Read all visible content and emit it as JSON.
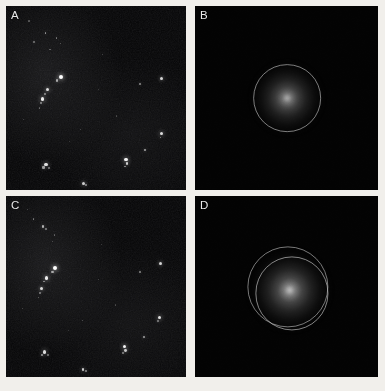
{
  "figure": {
    "background_color": "#f1efeb",
    "panel_background": "#050505",
    "label_color": "#e8e8e8",
    "ring_color": "#c4c4c4",
    "layout": "2x2 grid of image panels",
    "columns": 2,
    "rows": 2
  },
  "panels": [
    {
      "id": "A",
      "label": "A",
      "kind": "micrograph",
      "position": "top-left",
      "x": 6,
      "y": 6,
      "width": 180,
      "height": 184,
      "description": "dark field micrograph with scattered bright particles",
      "spots": [
        {
          "x": 0.22,
          "y": 0.145,
          "r": 0.9,
          "b": 0.55
        },
        {
          "x": 0.28,
          "y": 0.175,
          "r": 0.8,
          "b": 0.42
        },
        {
          "x": 0.155,
          "y": 0.195,
          "r": 0.7,
          "b": 0.38
        },
        {
          "x": 0.305,
          "y": 0.205,
          "r": 0.6,
          "b": 0.3
        },
        {
          "x": 0.245,
          "y": 0.235,
          "r": 0.7,
          "b": 0.34
        },
        {
          "x": 0.305,
          "y": 0.385,
          "r": 2.1,
          "b": 1.0
        },
        {
          "x": 0.285,
          "y": 0.405,
          "r": 1.1,
          "b": 0.62
        },
        {
          "x": 0.232,
          "y": 0.455,
          "r": 1.5,
          "b": 0.85
        },
        {
          "x": 0.218,
          "y": 0.478,
          "r": 0.9,
          "b": 0.5
        },
        {
          "x": 0.205,
          "y": 0.505,
          "r": 1.6,
          "b": 0.92
        },
        {
          "x": 0.196,
          "y": 0.527,
          "r": 0.8,
          "b": 0.44
        },
        {
          "x": 0.185,
          "y": 0.555,
          "r": 0.7,
          "b": 0.36
        },
        {
          "x": 0.862,
          "y": 0.392,
          "r": 1.5,
          "b": 0.82
        },
        {
          "x": 0.742,
          "y": 0.425,
          "r": 1.0,
          "b": 0.52
        },
        {
          "x": 0.866,
          "y": 0.695,
          "r": 1.6,
          "b": 0.86
        },
        {
          "x": 0.858,
          "y": 0.715,
          "r": 0.9,
          "b": 0.48
        },
        {
          "x": 0.773,
          "y": 0.783,
          "r": 1.2,
          "b": 0.62
        },
        {
          "x": 0.666,
          "y": 0.835,
          "r": 1.7,
          "b": 0.95
        },
        {
          "x": 0.672,
          "y": 0.858,
          "r": 1.4,
          "b": 0.78
        },
        {
          "x": 0.66,
          "y": 0.872,
          "r": 0.9,
          "b": 0.5
        },
        {
          "x": 0.222,
          "y": 0.862,
          "r": 1.6,
          "b": 0.88
        },
        {
          "x": 0.208,
          "y": 0.878,
          "r": 1.1,
          "b": 0.58
        },
        {
          "x": 0.238,
          "y": 0.882,
          "r": 0.8,
          "b": 0.42
        },
        {
          "x": 0.432,
          "y": 0.962,
          "r": 1.5,
          "b": 0.8
        },
        {
          "x": 0.447,
          "y": 0.972,
          "r": 1.0,
          "b": 0.52
        },
        {
          "x": 0.128,
          "y": 0.082,
          "r": 0.6,
          "b": 0.28
        },
        {
          "x": 0.535,
          "y": 0.262,
          "r": 0.6,
          "b": 0.26
        },
        {
          "x": 0.612,
          "y": 0.598,
          "r": 0.6,
          "b": 0.24
        },
        {
          "x": 0.415,
          "y": 0.672,
          "r": 0.6,
          "b": 0.26
        },
        {
          "x": 0.098,
          "y": 0.618,
          "r": 0.6,
          "b": 0.25
        },
        {
          "x": 0.515,
          "y": 0.455,
          "r": 0.5,
          "b": 0.22
        },
        {
          "x": 0.352,
          "y": 0.735,
          "r": 0.5,
          "b": 0.2
        }
      ]
    },
    {
      "id": "B",
      "label": "B",
      "kind": "diffraction",
      "position": "top-right",
      "x": 195,
      "y": 6,
      "width": 183,
      "height": 184,
      "description": "radial diffraction halo with single circular ring overlay",
      "center_x": 0.505,
      "center_y": 0.5,
      "glow_radius": 0.215,
      "glow_peak": 0.78,
      "rings": [
        {
          "radius": 0.185,
          "offset_x": 0.0,
          "offset_y": 0.0,
          "opacity": 0.62
        }
      ]
    },
    {
      "id": "C",
      "label": "C",
      "kind": "micrograph",
      "position": "bottom-left",
      "x": 6,
      "y": 196,
      "width": 180,
      "height": 181,
      "description": "dark field micrograph with scattered bright particles",
      "spots": [
        {
          "x": 0.152,
          "y": 0.128,
          "r": 0.8,
          "b": 0.44
        },
        {
          "x": 0.205,
          "y": 0.168,
          "r": 1.2,
          "b": 0.66
        },
        {
          "x": 0.222,
          "y": 0.182,
          "r": 0.8,
          "b": 0.42
        },
        {
          "x": 0.268,
          "y": 0.215,
          "r": 0.7,
          "b": 0.34
        },
        {
          "x": 0.258,
          "y": 0.252,
          "r": 0.6,
          "b": 0.28
        },
        {
          "x": 0.272,
          "y": 0.398,
          "r": 2.0,
          "b": 1.0
        },
        {
          "x": 0.258,
          "y": 0.418,
          "r": 1.1,
          "b": 0.6
        },
        {
          "x": 0.225,
          "y": 0.452,
          "r": 1.7,
          "b": 0.92
        },
        {
          "x": 0.212,
          "y": 0.472,
          "r": 0.9,
          "b": 0.48
        },
        {
          "x": 0.198,
          "y": 0.512,
          "r": 1.5,
          "b": 0.84
        },
        {
          "x": 0.19,
          "y": 0.535,
          "r": 0.8,
          "b": 0.42
        },
        {
          "x": 0.182,
          "y": 0.562,
          "r": 0.7,
          "b": 0.35
        },
        {
          "x": 0.858,
          "y": 0.372,
          "r": 1.5,
          "b": 0.82
        },
        {
          "x": 0.742,
          "y": 0.418,
          "r": 1.0,
          "b": 0.5
        },
        {
          "x": 0.852,
          "y": 0.672,
          "r": 1.6,
          "b": 0.88
        },
        {
          "x": 0.845,
          "y": 0.692,
          "r": 0.9,
          "b": 0.46
        },
        {
          "x": 0.768,
          "y": 0.778,
          "r": 1.2,
          "b": 0.6
        },
        {
          "x": 0.658,
          "y": 0.832,
          "r": 1.7,
          "b": 0.95
        },
        {
          "x": 0.664,
          "y": 0.855,
          "r": 1.4,
          "b": 0.76
        },
        {
          "x": 0.652,
          "y": 0.868,
          "r": 0.9,
          "b": 0.48
        },
        {
          "x": 0.215,
          "y": 0.862,
          "r": 1.6,
          "b": 0.86
        },
        {
          "x": 0.202,
          "y": 0.878,
          "r": 1.1,
          "b": 0.56
        },
        {
          "x": 0.232,
          "y": 0.88,
          "r": 0.8,
          "b": 0.4
        },
        {
          "x": 0.428,
          "y": 0.958,
          "r": 1.4,
          "b": 0.78
        },
        {
          "x": 0.443,
          "y": 0.968,
          "r": 1.0,
          "b": 0.5
        },
        {
          "x": 0.118,
          "y": 0.075,
          "r": 0.6,
          "b": 0.26
        },
        {
          "x": 0.425,
          "y": 0.688,
          "r": 0.7,
          "b": 0.3
        },
        {
          "x": 0.608,
          "y": 0.602,
          "r": 0.6,
          "b": 0.24
        },
        {
          "x": 0.092,
          "y": 0.622,
          "r": 0.6,
          "b": 0.24
        },
        {
          "x": 0.512,
          "y": 0.462,
          "r": 0.5,
          "b": 0.22
        },
        {
          "x": 0.345,
          "y": 0.742,
          "r": 0.5,
          "b": 0.2
        },
        {
          "x": 0.528,
          "y": 0.268,
          "r": 0.5,
          "b": 0.22
        }
      ]
    },
    {
      "id": "D",
      "label": "D",
      "kind": "diffraction",
      "position": "bottom-right",
      "x": 195,
      "y": 196,
      "width": 183,
      "height": 181,
      "description": "brighter radial diffraction halo with two circular ring overlays",
      "center_x": 0.518,
      "center_y": 0.522,
      "glow_radius": 0.245,
      "glow_peak": 0.86,
      "rings": [
        {
          "radius": 0.222,
          "offset_x": -0.012,
          "offset_y": -0.018,
          "opacity": 0.6
        },
        {
          "radius": 0.2,
          "offset_x": 0.012,
          "offset_y": 0.016,
          "opacity": 0.66
        }
      ]
    }
  ]
}
